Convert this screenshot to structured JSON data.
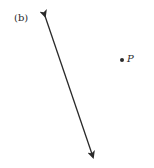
{
  "figure": {
    "panel_label": "(b)",
    "point_label": "P",
    "line": {
      "start": [
        45,
        16
      ],
      "end": [
        93,
        157
      ],
      "arrows": "both"
    },
    "point": {
      "x": 122,
      "y": 60
    },
    "stroke_color": "#2a2a2a"
  }
}
